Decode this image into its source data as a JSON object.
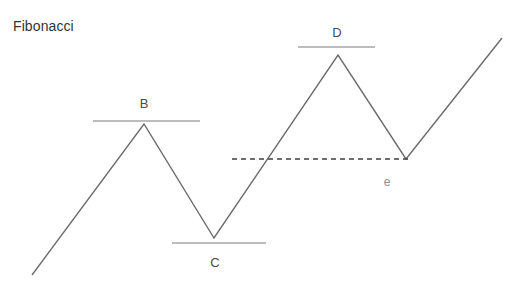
{
  "figure": {
    "title": "Fibonacci",
    "width": 528,
    "height": 294,
    "background_color": "#ffffff",
    "stroke_color": "#6b6b6b",
    "level_line_color": "#7a7a7a",
    "dashed_line_color": "#3f3f3f",
    "title_color": "#333333",
    "label_color": "#4a4a4a",
    "minor_label_color": "#8e8e8e"
  },
  "chart_data": {
    "type": "line",
    "title": "Fibonacci",
    "xlabel": "",
    "ylabel": "",
    "grid": false,
    "legend": "none",
    "xlim": [
      0,
      528
    ],
    "ylim": [
      294,
      0
    ],
    "series": [
      {
        "name": "price-zigzag",
        "points": [
          {
            "x": 32,
            "y": 275,
            "label": ""
          },
          {
            "x": 144,
            "y": 124,
            "label": "B"
          },
          {
            "x": 214,
            "y": 238,
            "label": "C"
          },
          {
            "x": 338,
            "y": 55,
            "label": "D"
          },
          {
            "x": 406,
            "y": 159,
            "label": "e"
          },
          {
            "x": 502,
            "y": 38,
            "label": ""
          }
        ]
      }
    ],
    "level_lines": [
      {
        "name": "level-b",
        "x1": 93,
        "x2": 200,
        "y": 121,
        "style": "solid"
      },
      {
        "name": "level-c",
        "x1": 172,
        "x2": 266,
        "y": 243,
        "style": "solid"
      },
      {
        "name": "level-d",
        "x1": 298,
        "x2": 375,
        "y": 47,
        "style": "solid"
      },
      {
        "name": "level-e",
        "x1": 232,
        "x2": 410,
        "y": 159,
        "style": "dashed"
      }
    ],
    "annotations": [
      {
        "name": "label-b",
        "text": "B",
        "x": 144,
        "y": 104,
        "emphasis": "major"
      },
      {
        "name": "label-c",
        "text": "C",
        "x": 215,
        "y": 263,
        "emphasis": "major"
      },
      {
        "name": "label-d",
        "text": "D",
        "x": 337,
        "y": 33,
        "emphasis": "major"
      },
      {
        "name": "label-e",
        "text": "e",
        "x": 387,
        "y": 183,
        "emphasis": "minor"
      }
    ]
  }
}
